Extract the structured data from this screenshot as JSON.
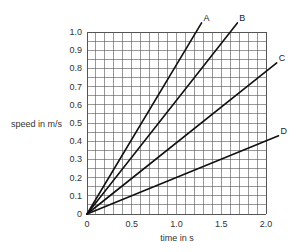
{
  "chart_data": {
    "type": "line",
    "title": "",
    "xlabel": "time in s",
    "ylabel": "speed in m/s",
    "xlim": [
      0,
      2.0
    ],
    "ylim": [
      0,
      1.0
    ],
    "x_ticks": [
      "0",
      "0.5",
      "1.0",
      "1.5",
      "2.0"
    ],
    "y_ticks": [
      "0",
      "0.1",
      "0.2",
      "0.3",
      "0.4",
      "0.5",
      "0.6",
      "0.7",
      "0.8",
      "0.9",
      "1.0"
    ],
    "grid": {
      "on": true,
      "x_minor_step": 0.1,
      "y_minor_step": 0.05
    },
    "legend": {
      "position": "inline-line-end"
    },
    "series": [
      {
        "name": "A",
        "x": [
          0,
          1.22,
          1.28
        ],
        "y": [
          0,
          1.0,
          1.05
        ],
        "slope": 0.82
      },
      {
        "name": "B",
        "x": [
          0,
          1.6,
          1.68
        ],
        "y": [
          0,
          1.0,
          1.05
        ],
        "slope": 0.625
      },
      {
        "name": "C",
        "x": [
          0,
          2.0,
          2.12
        ],
        "y": [
          0,
          0.78,
          0.83
        ],
        "slope": 0.39
      },
      {
        "name": "D",
        "x": [
          0,
          2.0,
          2.14
        ],
        "y": [
          0,
          0.4,
          0.43
        ],
        "slope": 0.2
      }
    ]
  },
  "labels": {
    "ylabel": "speed in m/s",
    "xlabel": "time in s"
  },
  "colors": {
    "grid": "#555555",
    "line": "#111111",
    "text": "#333333"
  }
}
